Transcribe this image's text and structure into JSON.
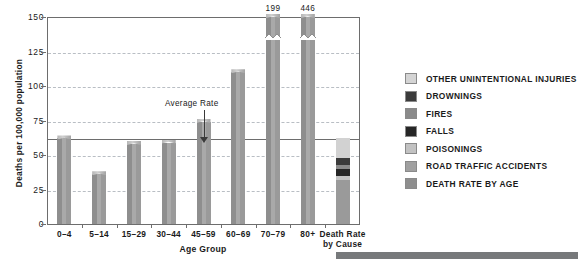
{
  "axes": {
    "y_title": "Deaths per 100,000 population",
    "x_title": "Age Group",
    "y_ticks": [
      "0",
      "25",
      "50",
      "75",
      "100",
      "125",
      "150"
    ]
  },
  "annotation": {
    "average_rate_label": "Average Rate"
  },
  "legend": {
    "items": [
      {
        "label": "OTHER UNINTENTIONAL INJURIES",
        "color": "#d4d4d4"
      },
      {
        "label": "DROWNINGS",
        "color": "#3b3b3b"
      },
      {
        "label": "FIRES",
        "color": "#8a8a8a"
      },
      {
        "label": "FALLS",
        "color": "#262626"
      },
      {
        "label": "POISONINGS",
        "color": "#c2c2c2"
      },
      {
        "label": "ROAD TRAFFIC ACCIDENTS",
        "color": "#a0a0a0"
      },
      {
        "label": "DEATH RATE BY AGE",
        "color": "#8e8e8e"
      }
    ]
  },
  "chart_data": {
    "type": "bar",
    "title": "",
    "xlabel": "Age Group",
    "ylabel": "Deaths per 100,000 population",
    "ylim": [
      0,
      150
    ],
    "grid": true,
    "legend_position": "right",
    "categories": [
      "0–4",
      "5–14",
      "15–29",
      "30–44",
      "45–59",
      "60–69",
      "70–79",
      "80+"
    ],
    "values": [
      62,
      36,
      58,
      59,
      74,
      110,
      199,
      446
    ],
    "value_labels": [
      "",
      "",
      "",
      "",
      "",
      "",
      "199",
      "446"
    ],
    "broken_axis_bars": [
      "70–79",
      "80+"
    ],
    "average_rate": 62,
    "stacked_bar": {
      "category": "Death Rate by Cause",
      "label_line1": "Death Rate",
      "label_line2": "by Cause",
      "total": 62,
      "segments": [
        {
          "name": "OTHER UNINTENTIONAL INJURIES",
          "value": 14,
          "color": "#d2d2d2"
        },
        {
          "name": "DROWNINGS",
          "value": 5,
          "color": "#3b3b3b"
        },
        {
          "name": "FIRES",
          "value": 3,
          "color": "#8a8a8a"
        },
        {
          "name": "FALLS",
          "value": 5,
          "color": "#262626"
        },
        {
          "name": "POISONINGS",
          "value": 3,
          "color": "#c2c2c2"
        },
        {
          "name": "ROAD TRAFFIC ACCIDENTS",
          "value": 32,
          "color": "#9a9a9a"
        }
      ]
    }
  }
}
